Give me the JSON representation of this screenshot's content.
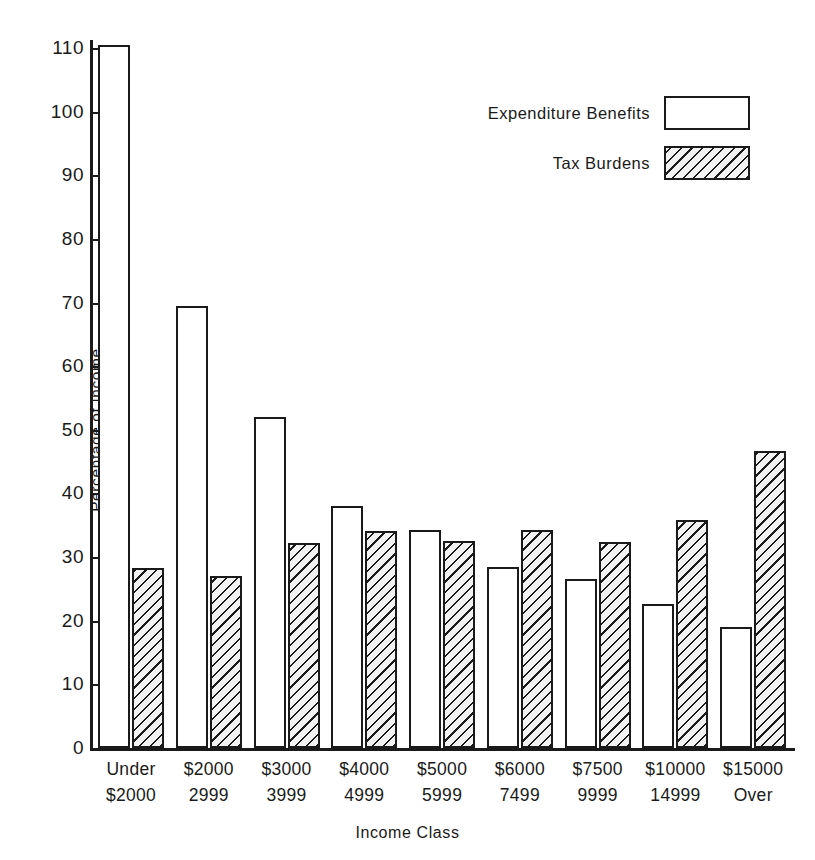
{
  "chart_data": {
    "type": "bar",
    "title": "",
    "xlabel": "Income Class",
    "ylabel": "Percentage of Income",
    "ylim": [
      0,
      110
    ],
    "yticks": [
      0,
      10,
      20,
      30,
      40,
      50,
      60,
      70,
      80,
      90,
      100,
      110
    ],
    "grid": false,
    "legend_position": "upper-right",
    "categories": [
      "Under\n$2000",
      "$2000\n2999",
      "$3000\n3999",
      "$4000\n4999",
      "$5000\n5999",
      "$6000\n7499",
      "$7500\n9999",
      "$10000\n14999",
      "$15000\nOver"
    ],
    "category_lines": [
      [
        "Under",
        "$2000"
      ],
      [
        "$2000",
        "2999"
      ],
      [
        "$3000",
        "3999"
      ],
      [
        "$4000",
        "4999"
      ],
      [
        "$5000",
        "5999"
      ],
      [
        "$6000",
        "7499"
      ],
      [
        "$7500",
        "9999"
      ],
      [
        "$10000",
        "14999"
      ],
      [
        "$15000",
        "Over"
      ]
    ],
    "series": [
      {
        "name": "Expenditure Benefits",
        "fill": "white",
        "values": [
          110.5,
          69.5,
          52.0,
          38.0,
          34.2,
          28.5,
          26.5,
          22.7,
          19.0
        ]
      },
      {
        "name": "Tax Burdens",
        "fill": "diagonal-hatch",
        "values": [
          28.3,
          27.1,
          32.2,
          34.1,
          32.5,
          34.3,
          32.3,
          35.9,
          46.6
        ]
      }
    ]
  },
  "legend": {
    "items": [
      {
        "label": "Expenditure Benefits",
        "style": "exp"
      },
      {
        "label": "Tax Burdens",
        "style": "tax"
      }
    ]
  },
  "axis": {
    "y_title": "Percentage of Income",
    "x_title": "Income Class"
  },
  "colors": {
    "ink": "#1a1a1a",
    "background": "#ffffff",
    "hatch_fill": "#f2f2f2"
  }
}
